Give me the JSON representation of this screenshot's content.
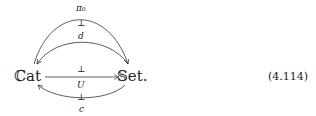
{
  "diagram": {
    "objects": [
      {
        "id": "cat",
        "label": "ℂat"
      },
      {
        "id": "set",
        "label": "𝕊et."
      }
    ],
    "arrows": [
      {
        "id": "pi0",
        "label": "π₀",
        "from": "cat",
        "to": "set",
        "adjoint_symbol": "⊥"
      },
      {
        "id": "d",
        "label": "d",
        "from": "set",
        "to": "cat",
        "adjoint_symbol": "⊥"
      },
      {
        "id": "U",
        "label": "U",
        "from": "cat",
        "to": "set",
        "adjoint_symbol": "⊥"
      },
      {
        "id": "c",
        "label": "c",
        "from": "set",
        "to": "cat"
      }
    ],
    "equation_number": "(4.114)"
  }
}
